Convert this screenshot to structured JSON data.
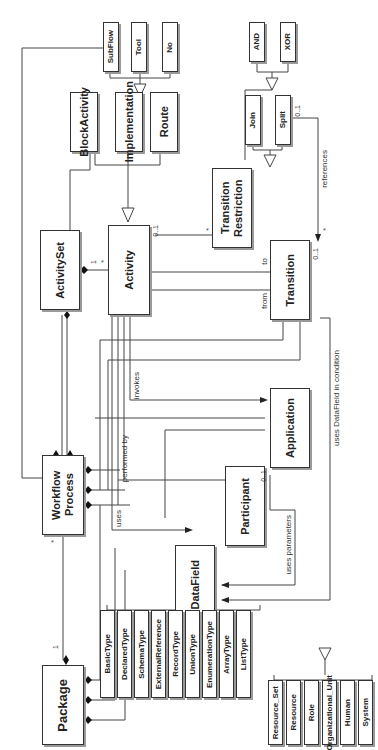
{
  "diagram": {
    "type": "UML class diagram (rotated 90°)",
    "classes": {
      "package": "Package",
      "workflow_process": "Workflow Process",
      "activity_set": "ActivitySet",
      "activity": "Activity",
      "block_activity": "BlockActivity",
      "implementation": "Implementation",
      "route": "Route",
      "subflow": "SubFlow",
      "tool": "Tool",
      "no": "No",
      "transition_restriction": "Transition Restriction",
      "join": "Join",
      "split": "Split",
      "and": "AND",
      "xor": "XOR",
      "transition": "Transition",
      "application": "Application",
      "participant": "Participant",
      "data_field": "DataField"
    },
    "data_types": [
      "BasicType",
      "DeclaredType",
      "SchemaType",
      "ExternalReference",
      "RecordType",
      "UnionType",
      "EnumerationType",
      "ArrayType",
      "ListType"
    ],
    "participant_types": [
      "Resource_Set",
      "Resource",
      "Role",
      "Organizational_Unit",
      "Human",
      "System"
    ],
    "association_labels": {
      "references": "references",
      "to": "to",
      "from": "from",
      "invokes": "invokes",
      "performed_by": "performed by",
      "uses": "uses",
      "uses_parameters": "uses parameters",
      "uses_datafield": "uses DataField in condition"
    },
    "multiplicities": {
      "one": "1",
      "many": "*",
      "zero_one": "0..1"
    }
  }
}
